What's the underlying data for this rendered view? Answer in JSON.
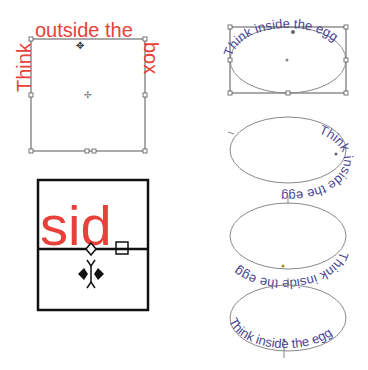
{
  "figures": {
    "box": {
      "text_left": "Think",
      "text_top": "outside the",
      "text_right": "box",
      "color": "#e8413a"
    },
    "zoom_detail": {
      "text": "sid",
      "color": "#e8413a"
    },
    "eggs": [
      {
        "text": "Think inside the egg",
        "position": "top"
      },
      {
        "text": "Think inside the egg",
        "position": "right-bottom"
      },
      {
        "text": "Think inside the egg",
        "position": "bottom-flipped"
      },
      {
        "text": "Think inside the egg",
        "position": "bottom"
      }
    ],
    "egg_color": "#4a4596"
  }
}
